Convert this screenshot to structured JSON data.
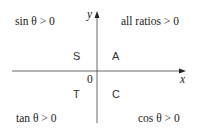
{
  "diagram": {
    "title": "",
    "axes": {
      "x_label": "x",
      "y_label": "y",
      "origin_label": "0"
    },
    "quadrants": {
      "q1": {
        "letter": "A",
        "condition": "all ratios > 0"
      },
      "q2": {
        "letter": "S",
        "condition": "sin θ > 0"
      },
      "q3": {
        "letter": "T",
        "condition": "tan θ > 0"
      },
      "q4": {
        "letter": "C",
        "condition": "cos θ > 0"
      }
    },
    "colors": {
      "axis": "#333333",
      "text": "#222222",
      "background": "#ffffff"
    }
  }
}
